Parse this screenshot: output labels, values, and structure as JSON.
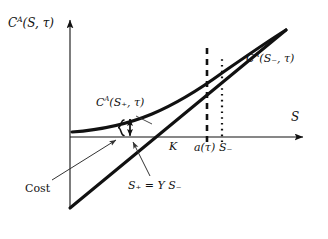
{
  "figure": {
    "kind": "economics-diagram",
    "background_color": "#ffffff",
    "ink_color": "#111111",
    "axes": {
      "y_axis_label": "Cᴬ(S, τ)",
      "y_axis_label_parts": {
        "base": "C",
        "exponent": "A",
        "arg": "(S, τ)"
      },
      "x_axis_label": "S",
      "origin_px": [
        70,
        137
      ],
      "x_axis_end_px": [
        305,
        137
      ],
      "y_axis_top_px": [
        70,
        18
      ]
    },
    "curves": [
      {
        "id": "call-value-curve",
        "label": "Cᴬ(S₊, τ)",
        "label_parts": {
          "base": "C",
          "exponent": "A",
          "arg": "(S₊, τ)"
        },
        "style": "solid-thick-convex"
      },
      {
        "id": "exercise-payoff-line",
        "label": "Cᴬ(S₋, τ)",
        "label_parts": {
          "base": "C",
          "exponent": "A",
          "arg": "(S₋, τ)"
        },
        "style": "solid-thick-straight"
      }
    ],
    "vertical_lines": [
      {
        "id": "a-tau-line",
        "style": "dashed",
        "x_px": 207,
        "tick_label": "a(τ)"
      },
      {
        "id": "s-minus-line",
        "style": "dotted",
        "x_px": 222,
        "tick_label": "S₋"
      }
    ],
    "x_tick_labels": [
      {
        "id": "strike",
        "text": "K",
        "x_px": 173
      },
      {
        "id": "a-tau",
        "text": "a(τ)",
        "x_px": 207
      },
      {
        "id": "s-minus",
        "text": "S₋",
        "x_px": 224
      }
    ],
    "annotations": [
      {
        "id": "cost-annotation",
        "text": "Cost",
        "upright": true,
        "pointer": "thin-arrow-to-brace"
      },
      {
        "id": "s-plus-annotation",
        "text": "S₊ = Y S₋",
        "pointer": "thin-arrow-to-line-crossing"
      }
    ],
    "brace": {
      "id": "cost-brace",
      "glyph": "{",
      "double_arrow": "↕"
    }
  }
}
